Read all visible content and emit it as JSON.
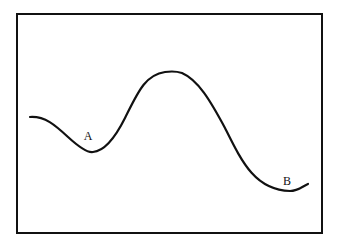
{
  "diagram": {
    "type": "curve-diagram",
    "frame": {
      "x": 17,
      "y": 14,
      "width": 305,
      "height": 219,
      "stroke": "#111111"
    },
    "curve": {
      "stroke": "#111111",
      "path": "M30,117 C45,116 55,125 68,137 C80,148 88,153 93,152 C105,151 115,138 125,118 C138,92 145,75 165,72 C172,71 176,71 182,73 C198,80 210,100 225,128 C242,162 255,190 290,191 C298,191 303,186 308,184"
    },
    "labels": [
      {
        "text": "A",
        "x": 88,
        "y": 140
      },
      {
        "text": "B",
        "x": 287,
        "y": 185
      }
    ],
    "key_points": [
      {
        "name": "start",
        "x": 30,
        "y": 117
      },
      {
        "name": "A (local minimum)",
        "x": 92,
        "y": 152
      },
      {
        "name": "peak (maximum)",
        "x": 170,
        "y": 72
      },
      {
        "name": "B (minimum)",
        "x": 288,
        "y": 191
      },
      {
        "name": "end",
        "x": 308,
        "y": 184
      }
    ]
  }
}
